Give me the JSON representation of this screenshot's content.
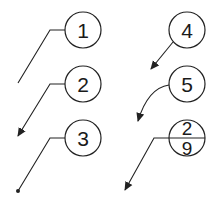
{
  "diagram": {
    "callouts": [
      {
        "id": "callout-1",
        "label": "1",
        "leader": "straight-with-shoulder",
        "terminator": "none"
      },
      {
        "id": "callout-2",
        "label": "2",
        "leader": "straight-with-shoulder",
        "terminator": "arrow"
      },
      {
        "id": "callout-3",
        "label": "3",
        "leader": "straight-with-shoulder",
        "terminator": "dot"
      },
      {
        "id": "callout-4",
        "label": "4",
        "leader": "straight",
        "terminator": "arrow"
      },
      {
        "id": "callout-5",
        "label": "5",
        "leader": "curved",
        "terminator": "arrow"
      },
      {
        "id": "callout-split",
        "label_top": "2",
        "label_bottom": "9",
        "leader": "straight-with-shoulder",
        "terminator": "arrow"
      }
    ],
    "colors": {
      "stroke": "#222222",
      "background": "#ffffff"
    }
  }
}
